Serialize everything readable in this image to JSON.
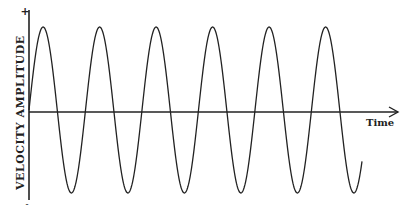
{
  "diagram": {
    "y_axis_label": "VELOCITY AMPLITUDE",
    "x_axis_label": "Time",
    "y_plus": "+",
    "y_minus": "-",
    "waveform": {
      "type": "sine",
      "cycles": 6,
      "start_phase": "zero-rising",
      "stroke": "#222222"
    }
  }
}
